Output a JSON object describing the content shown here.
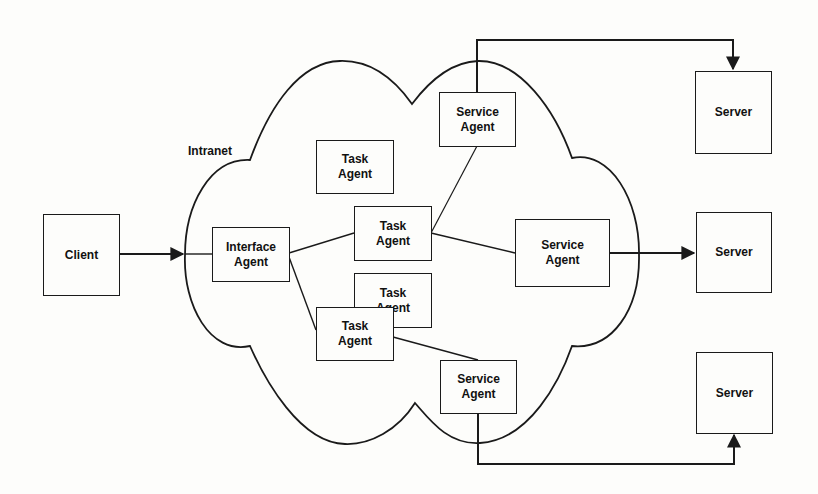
{
  "diagram": {
    "cloud_label": "Intranet",
    "client": {
      "label": "Client"
    },
    "interface_agent": {
      "line1": "Interface",
      "line2": "Agent"
    },
    "task_agents": [
      {
        "line1": "Task",
        "line2": "Agent"
      },
      {
        "line1": "Task",
        "line2": "Agent"
      },
      {
        "line1": "Task",
        "line2": "Agent"
      },
      {
        "line1": "Task",
        "line2": "Agent"
      }
    ],
    "service_agents": [
      {
        "line1": "Service",
        "line2": "Agent"
      },
      {
        "line1": "Service",
        "line2": "Agent"
      },
      {
        "line1": "Service",
        "line2": "Agent"
      }
    ],
    "servers": [
      {
        "label": "Server"
      },
      {
        "label": "Server"
      },
      {
        "label": "Server"
      }
    ],
    "colors": {
      "stroke": "#1a1a1a",
      "background": "#fdfdfb",
      "text": "#111111"
    }
  }
}
